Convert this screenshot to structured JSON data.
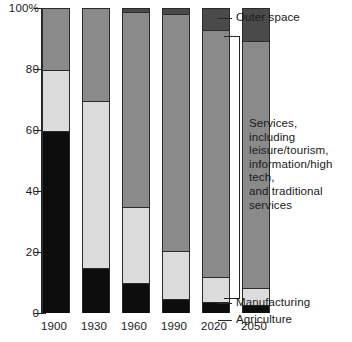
{
  "chart_data": {
    "type": "bar",
    "stacked": true,
    "title": "",
    "xlabel": "",
    "ylabel": "",
    "ylim": [
      0,
      100
    ],
    "grid": false,
    "legend_position": "right-callouts",
    "categories": [
      "1900",
      "1930",
      "1960",
      "1990",
      "2020",
      "2050"
    ],
    "ytick_labels": [
      "0",
      "20",
      "40",
      "60",
      "80",
      "100%"
    ],
    "ytick_values": [
      0,
      20,
      40,
      60,
      80,
      100
    ],
    "series": [
      {
        "name": "Agriculture",
        "color": "#0d0d0d",
        "values": [
          60,
          15,
          10,
          5,
          4,
          3
        ]
      },
      {
        "name": "Manufacturing",
        "color": "#dcdcdc",
        "values": [
          20,
          55,
          25,
          15.5,
          8,
          5.5
        ]
      },
      {
        "name": "Services, including leisure/tourism, information/high tech, and traditional services",
        "color": "#8a8a8a",
        "values": [
          20,
          30,
          64,
          78,
          81,
          81
        ]
      },
      {
        "name": "Outer space",
        "color": "#4a4a4a",
        "values": [
          0,
          0,
          1,
          1.5,
          7,
          10.5
        ]
      }
    ],
    "annotations": [
      "Outer space",
      "Services, including leisure/tourism, information/high tech, and traditional services",
      "Manufacturing",
      "Agriculture"
    ]
  },
  "axis": {
    "ticks": [
      {
        "label": "100%",
        "value": 100
      },
      {
        "label": "80",
        "value": 80
      },
      {
        "label": "60",
        "value": 60
      },
      {
        "label": "40",
        "value": 40
      },
      {
        "label": "20",
        "value": 20
      },
      {
        "label": "0",
        "value": 0
      }
    ]
  },
  "xlabels": [
    "1900",
    "1930",
    "1960",
    "1990",
    "2020",
    "2050"
  ],
  "callouts": {
    "outer_space": "Outer space",
    "services": "Services,\nincluding\nleisure/tourism,\ninformation/high tech,\nand traditional\nservices",
    "manufacturing": "Manufacturing",
    "agriculture": "Agriculture"
  }
}
